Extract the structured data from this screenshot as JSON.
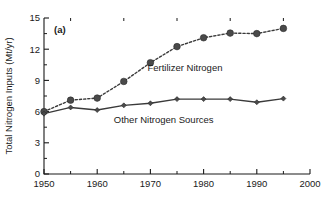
{
  "chart_data": {
    "type": "line",
    "title": "",
    "panel_label": "(a)",
    "xlabel": "",
    "ylabel": "Total Nitrogen Inputs (Mt/yr)",
    "xlim": [
      1950,
      2000
    ],
    "ylim": [
      0,
      15
    ],
    "xticks": [
      1950,
      1960,
      1970,
      1980,
      1990,
      2000
    ],
    "xtick_labels": [
      "1950",
      "1960",
      "1970",
      "1980",
      "1990",
      "2000"
    ],
    "xminorticks": [
      1955,
      1965,
      1975,
      1985,
      1995
    ],
    "yticks": [
      0,
      3,
      6,
      9,
      12,
      15
    ],
    "ytick_labels": [
      "0",
      "3",
      "6",
      "9",
      "12",
      "15"
    ],
    "yminorticks": [
      1.5,
      4.5,
      7.5,
      10.5,
      13.5
    ],
    "grid": false,
    "legend_position": "inline-annotation",
    "x": [
      1950,
      1955,
      1960,
      1965,
      1970,
      1975,
      1980,
      1985,
      1990,
      1995
    ],
    "series": [
      {
        "name": "Fertilizer Nitrogen",
        "marker": "circle",
        "marker_size": "large",
        "linestyle": "dotted",
        "color": "#4a4a4a",
        "values": [
          6.0,
          7.1,
          7.3,
          8.9,
          10.7,
          12.25,
          13.1,
          13.55,
          13.5,
          14.0
        ]
      },
      {
        "name": "Other Nitrogen Sources",
        "marker": "diamond",
        "marker_size": "small",
        "linestyle": "solid",
        "color": "#4a4a4a",
        "values": [
          5.8,
          6.4,
          6.15,
          6.6,
          6.8,
          7.2,
          7.2,
          7.2,
          6.9,
          7.25
        ]
      }
    ],
    "annotations": [
      {
        "text": "Fertilizer Nitrogen",
        "x": 1976.5,
        "y": 9.9
      },
      {
        "text": "Other Nitrogen Sources",
        "x": 1972.5,
        "y": 4.9
      }
    ],
    "colors": {
      "axis": "#1a1a1a",
      "series": "#4a4a4a",
      "background": "#ffffff"
    }
  }
}
